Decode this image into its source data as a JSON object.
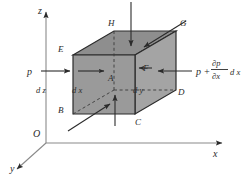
{
  "figure": {
    "type": "diagram",
    "background_color": "#ffffff",
    "ink_color": "#2b2b2b",
    "face_front_color": "#9a9a9a",
    "face_top_color": "#8e8e8e",
    "face_right_color": "#a4a4a4"
  },
  "axes": {
    "z_label": "z",
    "x_label": "x",
    "y_label": "y",
    "origin_label": "O"
  },
  "vertices": {
    "H": "H",
    "G": "G",
    "E": "E",
    "F": "F",
    "A": "A",
    "D": "D",
    "B": "B",
    "C": "C"
  },
  "dimensions": {
    "dz": "d z",
    "dx": "d x",
    "dy": "d y"
  },
  "forces": {
    "left_pressure": "p",
    "right_pressure_p": "p +",
    "right_pressure_num": "∂p",
    "right_pressure_den": "∂x",
    "right_pressure_dx": "d x"
  }
}
